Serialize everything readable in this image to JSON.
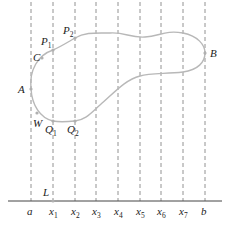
{
  "diagram": {
    "type": "region-between-curves-partition",
    "colors": {
      "curve": "#b8b8b8",
      "dashed": "#777777",
      "axis": "#444444",
      "text": "#222222",
      "point": "#b0b0b0"
    },
    "axis": {
      "y": 201,
      "x_start": 8,
      "x_end": 222
    },
    "partition": [
      {
        "id": "a",
        "name": "a",
        "sub": "",
        "x": 31
      },
      {
        "id": "x1",
        "name": "x",
        "sub": "1",
        "x": 53
      },
      {
        "id": "x2",
        "name": "x",
        "sub": "2",
        "x": 75
      },
      {
        "id": "x3",
        "name": "x",
        "sub": "3",
        "x": 96
      },
      {
        "id": "x4",
        "name": "x",
        "sub": "4",
        "x": 118
      },
      {
        "id": "x5",
        "name": "x",
        "sub": "5",
        "x": 140
      },
      {
        "id": "x6",
        "name": "x",
        "sub": "6",
        "x": 161
      },
      {
        "id": "x7",
        "name": "x",
        "sub": "7",
        "x": 183
      },
      {
        "id": "b",
        "name": "b",
        "sub": "",
        "x": 205
      }
    ],
    "points": [
      {
        "id": "A",
        "name": "A",
        "sub": "",
        "x": 31,
        "y": 89,
        "lx": 18,
        "ly": 93
      },
      {
        "id": "B",
        "name": "B",
        "sub": "",
        "x": 205,
        "y": 53,
        "lx": 210,
        "ly": 57
      },
      {
        "id": "C",
        "name": "C",
        "sub": "",
        "x": 42,
        "y": 58,
        "lx": 33,
        "ly": 61
      },
      {
        "id": "P1",
        "name": "P",
        "sub": "1",
        "x": 53,
        "y": 50,
        "lx": 41,
        "ly": 45
      },
      {
        "id": "P2",
        "name": "P",
        "sub": "2",
        "x": 75,
        "y": 38,
        "lx": 63,
        "ly": 34
      },
      {
        "id": "W",
        "name": "W",
        "sub": "",
        "x": 37,
        "y": 113,
        "lx": 33,
        "ly": 127
      },
      {
        "id": "Q1",
        "name": "Q",
        "sub": "1",
        "x": 53,
        "y": 121,
        "lx": 45,
        "ly": 133
      },
      {
        "id": "Q2",
        "name": "Q",
        "sub": "2",
        "x": 75,
        "y": 121,
        "lx": 67,
        "ly": 133
      },
      {
        "id": "L",
        "name": "L",
        "sub": "",
        "x": 53,
        "y": 201,
        "lx": 43,
        "ly": 196
      }
    ]
  }
}
